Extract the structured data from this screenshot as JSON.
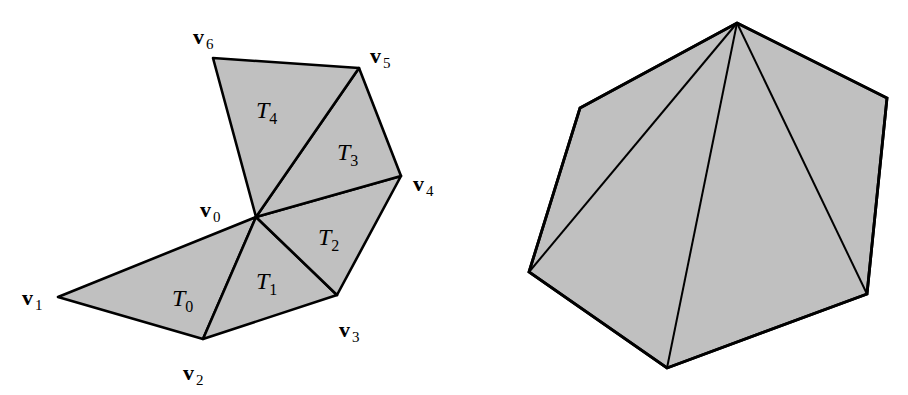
{
  "figure": {
    "left": {
      "title": "triangle fan around v0",
      "fill_color": "#c0c0c0",
      "stroke_color": "#000000",
      "vertices": [
        {
          "id": "v0",
          "base": "v",
          "sub": "0",
          "x": 256,
          "y": 217,
          "label_x": 200,
          "label_y": 217
        },
        {
          "id": "v1",
          "base": "v",
          "sub": "1",
          "x": 58,
          "y": 297,
          "label_x": 22,
          "label_y": 305
        },
        {
          "id": "v2",
          "base": "v",
          "sub": "2",
          "x": 203,
          "y": 339,
          "label_x": 183,
          "label_y": 380
        },
        {
          "id": "v3",
          "base": "v",
          "sub": "3",
          "x": 337,
          "y": 295,
          "label_x": 339,
          "label_y": 337
        },
        {
          "id": "v4",
          "base": "v",
          "sub": "4",
          "x": 401,
          "y": 176,
          "label_x": 413,
          "label_y": 191
        },
        {
          "id": "v5",
          "base": "v",
          "sub": "5",
          "x": 359,
          "y": 68,
          "label_x": 370,
          "label_y": 63
        },
        {
          "id": "v6",
          "base": "v",
          "sub": "6",
          "x": 213,
          "y": 58,
          "label_x": 193,
          "label_y": 44
        }
      ],
      "triangles": [
        {
          "id": "T0",
          "base": "T",
          "sub": "0",
          "verts": [
            "v0",
            "v1",
            "v2"
          ],
          "label_x": 172,
          "label_y": 306
        },
        {
          "id": "T1",
          "base": "T",
          "sub": "1",
          "verts": [
            "v0",
            "v2",
            "v3"
          ],
          "label_x": 256,
          "label_y": 289
        },
        {
          "id": "T2",
          "base": "T",
          "sub": "2",
          "verts": [
            "v0",
            "v3",
            "v4"
          ],
          "label_x": 318,
          "label_y": 245
        },
        {
          "id": "T3",
          "base": "T",
          "sub": "3",
          "verts": [
            "v0",
            "v4",
            "v5"
          ],
          "label_x": 337,
          "label_y": 160
        },
        {
          "id": "T4",
          "base": "T",
          "sub": "4",
          "verts": [
            "v0",
            "v5",
            "v6"
          ],
          "label_x": 256,
          "label_y": 118
        }
      ]
    },
    "right": {
      "title": "hexagon fan triangulation from top vertex",
      "fill_color": "#c0c0c0",
      "stroke_color": "#000000",
      "vertices": [
        {
          "id": "p0",
          "x": 737,
          "y": 23
        },
        {
          "id": "p1",
          "x": 887,
          "y": 98
        },
        {
          "id": "p2",
          "x": 867,
          "y": 294
        },
        {
          "id": "p3",
          "x": 667,
          "y": 368
        },
        {
          "id": "p4",
          "x": 529,
          "y": 272
        },
        {
          "id": "p5",
          "x": 580,
          "y": 108
        }
      ],
      "diagonals": [
        {
          "from": "p0",
          "to": "p4"
        },
        {
          "from": "p0",
          "to": "p3"
        },
        {
          "from": "p0",
          "to": "p2"
        }
      ]
    }
  }
}
